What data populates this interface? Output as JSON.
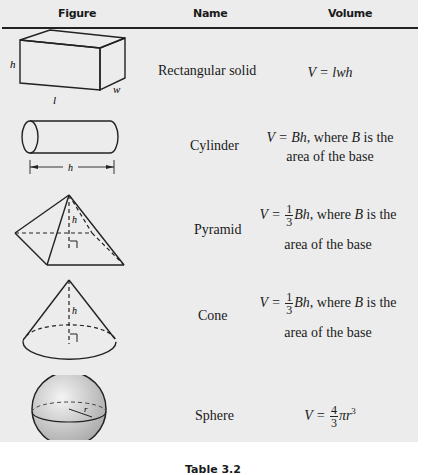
{
  "header": {
    "col_figure": "Figure",
    "col_name": "Name",
    "col_volume": "Volume"
  },
  "rows": [
    {
      "name": "Rectangular solid",
      "formula_lhs": "V = ",
      "formula_rhs": "lwh",
      "labels": {
        "h": "h",
        "l": "l",
        "w": "w"
      }
    },
    {
      "name": "Cylinder",
      "formula_lhs": "V = ",
      "formula_var": "Bh",
      "formula_rest1": ", where ",
      "formula_B": "B",
      "formula_rest2": " is the",
      "formula_line2": "area of the base",
      "labels": {
        "h": "h"
      }
    },
    {
      "name": "Pyramid",
      "formula_lhs": "V = ",
      "frac_num": "1",
      "frac_den": "3",
      "formula_var": "Bh",
      "formula_rest1": ", where ",
      "formula_B": "B",
      "formula_rest2": " is the",
      "formula_line2": "area of the base",
      "labels": {
        "h": "h"
      }
    },
    {
      "name": "Cone",
      "formula_lhs": "V = ",
      "frac_num": "1",
      "frac_den": "3",
      "formula_var": "Bh",
      "formula_rest1": ", where ",
      "formula_B": "B",
      "formula_rest2": " is the",
      "formula_line2": "area of the base",
      "labels": {
        "h": "h"
      }
    },
    {
      "name": "Sphere",
      "formula_lhs": "V = ",
      "frac_num": "4",
      "frac_den": "3",
      "formula_var": "πr",
      "formula_exp": "3",
      "labels": {
        "r": "r"
      }
    }
  ],
  "caption": "Table 3.2"
}
